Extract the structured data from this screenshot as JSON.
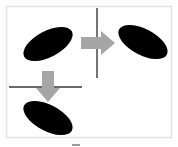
{
  "diagram": {
    "colors": {
      "background": "#ffffff",
      "frame_border": "#e2e2e2",
      "shape_fill": "#000000",
      "mirror_line": "#3a3a3a",
      "arrow_fill": "#a6a6a6",
      "footer_mark": "#9a9a9a"
    },
    "elements": {
      "original_shape": {
        "type": "ellipse",
        "label": "original",
        "tilt": "rising to the right"
      },
      "vertical_mirror": {
        "type": "line",
        "orientation": "vertical"
      },
      "reflection_arrow_right": {
        "type": "arrow",
        "direction": "right"
      },
      "reflected_shape_right": {
        "type": "ellipse",
        "label": "reflected across vertical line",
        "tilt": "falling to the right"
      },
      "horizontal_mirror": {
        "type": "line",
        "orientation": "horizontal"
      },
      "reflection_arrow_down": {
        "type": "arrow",
        "direction": "down"
      },
      "reflected_shape_bottom": {
        "type": "ellipse",
        "label": "reflected across horizontal line",
        "tilt": "falling to the right"
      }
    }
  }
}
